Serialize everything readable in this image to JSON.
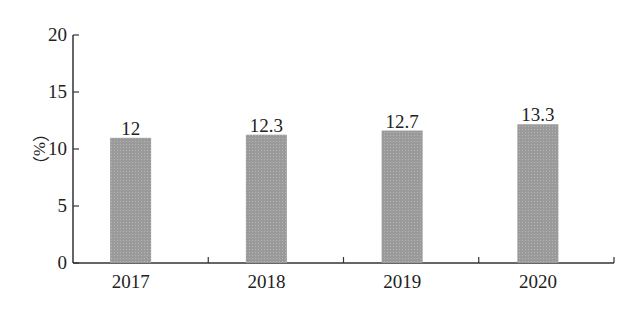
{
  "chart_data": {
    "type": "bar",
    "title": "",
    "xlabel": "",
    "ylabel": "（%）",
    "categories": [
      "2017",
      "2018",
      "2019",
      "2020"
    ],
    "values": [
      12,
      12.3,
      12.7,
      13.3
    ],
    "data_labels": [
      "12",
      "12.3",
      "12.7",
      "13.3"
    ],
    "ylim": [
      0,
      20
    ],
    "yticks": [
      "0",
      "5",
      "10",
      "15",
      "20"
    ],
    "grid": false,
    "legend": null,
    "bar_color": "#9a9a9a",
    "axis_color": "#333333"
  }
}
